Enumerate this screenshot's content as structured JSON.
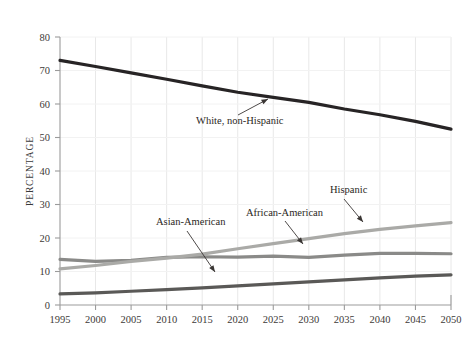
{
  "chart_data": {
    "type": "line",
    "title": "",
    "subtitle": "",
    "xlabel": "",
    "ylabel": "PERCENTAGE",
    "xlim": [
      1995,
      2050
    ],
    "ylim": [
      0,
      80
    ],
    "yticks": [
      0,
      10,
      20,
      30,
      40,
      50,
      60,
      70,
      80
    ],
    "xticks": [
      1995,
      2000,
      2005,
      2010,
      2015,
      2020,
      2025,
      2030,
      2035,
      2040,
      2045,
      2050
    ],
    "x": [
      1995,
      2000,
      2005,
      2010,
      2015,
      2020,
      2025,
      2030,
      2035,
      2040,
      2045,
      2050
    ],
    "grid": "vertical",
    "legend_position": "inline-annotations",
    "series": [
      {
        "name": "White, non-Hispanic",
        "color": "#272425",
        "width": 3.2,
        "values": [
          73.0,
          71.2,
          69.3,
          67.4,
          65.4,
          63.5,
          62.0,
          60.5,
          58.5,
          56.8,
          54.8,
          52.5
        ]
      },
      {
        "name": "African-American",
        "color": "#8a8a88",
        "width": 3.2,
        "values": [
          13.6,
          13.0,
          13.3,
          14.2,
          14.4,
          14.3,
          14.6,
          14.2,
          14.9,
          15.4,
          15.4,
          15.3
        ]
      },
      {
        "name": "Hispanic",
        "color": "#aaaaa7",
        "width": 3.2,
        "values": [
          10.8,
          11.8,
          13.0,
          14.0,
          15.2,
          16.8,
          18.3,
          19.8,
          21.3,
          22.6,
          23.6,
          24.6
        ]
      },
      {
        "name": "Asian-American",
        "color": "#5a5957",
        "width": 3.2,
        "values": [
          3.3,
          3.6,
          4.1,
          4.6,
          5.1,
          5.7,
          6.3,
          6.9,
          7.5,
          8.1,
          8.6,
          9.0
        ]
      }
    ],
    "annotations": [
      {
        "label": "White, non-Hispanic",
        "text_x": 196,
        "text_y": 124,
        "anchor": "start",
        "leader": {
          "x1": 238,
          "y1": 115,
          "x2": 268,
          "y2": 99
        }
      },
      {
        "label": "Asian-American",
        "text_x": 156,
        "text_y": 225,
        "anchor": "start",
        "leader": {
          "x1": 187,
          "y1": 231,
          "x2": 215,
          "y2": 272
        }
      },
      {
        "label": "African-American",
        "text_x": 246,
        "text_y": 216,
        "anchor": "start",
        "leader": {
          "x1": 285,
          "y1": 221,
          "x2": 303,
          "y2": 244
        }
      },
      {
        "label": "Hispanic",
        "text_x": 330,
        "text_y": 193,
        "anchor": "start",
        "leader": {
          "x1": 344,
          "y1": 199,
          "x2": 363,
          "y2": 222
        }
      }
    ],
    "style": {
      "axis_color": "#9b9b9b",
      "grid_color": "#e8e8e8",
      "text_color": "#3d3a38",
      "background": "#ffffff"
    }
  }
}
